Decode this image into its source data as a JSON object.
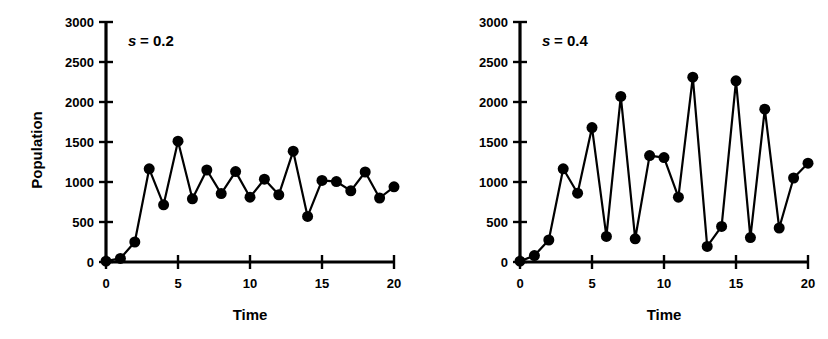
{
  "figure": {
    "background_color": "#ffffff",
    "ink_color": "#000000",
    "panel_count": 2
  },
  "chart_data": [
    {
      "type": "line",
      "panel_id": "left",
      "title": "",
      "annotation": "s = 0.2",
      "annotation_symbol": "s",
      "annotation_value": "= 0.2",
      "xlabel": "Time",
      "ylabel": "Population",
      "xlim": [
        0,
        20
      ],
      "ylim": [
        0,
        3000
      ],
      "xticks": [
        0,
        5,
        10,
        15,
        20
      ],
      "xtick_labels": [
        "0",
        "5",
        "10",
        "15",
        "20"
      ],
      "yticks": [
        0,
        500,
        1000,
        1500,
        2000,
        2500,
        3000
      ],
      "ytick_labels": [
        "0",
        "500",
        "1000",
        "1500",
        "2000",
        "2500",
        "3000"
      ],
      "grid": false,
      "legend": false,
      "marker": "filled-circle",
      "marker_size": 11,
      "x": [
        0,
        1,
        2,
        3,
        4,
        5,
        6,
        7,
        8,
        9,
        10,
        11,
        12,
        13,
        14,
        15,
        16,
        17,
        18,
        19,
        20
      ],
      "values": [
        10,
        45,
        250,
        1165,
        715,
        1510,
        790,
        1150,
        855,
        1130,
        810,
        1035,
        840,
        1385,
        570,
        1020,
        1005,
        890,
        1125,
        800,
        940
      ]
    },
    {
      "type": "line",
      "panel_id": "right",
      "title": "",
      "annotation": "s = 0.4",
      "annotation_symbol": "s",
      "annotation_value": "= 0.4",
      "xlabel": "Time",
      "ylabel": "",
      "xlim": [
        0,
        20
      ],
      "ylim": [
        0,
        3000
      ],
      "xticks": [
        0,
        5,
        10,
        15,
        20
      ],
      "xtick_labels": [
        "0",
        "5",
        "10",
        "15",
        "20"
      ],
      "yticks": [
        0,
        500,
        1000,
        1500,
        2000,
        2500,
        3000
      ],
      "ytick_labels": [
        "0",
        "500",
        "1000",
        "1500",
        "2000",
        "2500",
        "3000"
      ],
      "grid": false,
      "legend": false,
      "marker": "filled-circle",
      "marker_size": 11,
      "x": [
        0,
        1,
        2,
        3,
        4,
        5,
        6,
        7,
        8,
        9,
        10,
        11,
        12,
        13,
        14,
        15,
        16,
        17,
        18,
        19,
        20
      ],
      "values": [
        10,
        80,
        275,
        1165,
        860,
        1680,
        320,
        2070,
        290,
        1330,
        1305,
        810,
        2310,
        195,
        445,
        2265,
        305,
        1910,
        425,
        1050,
        1235
      ]
    }
  ]
}
